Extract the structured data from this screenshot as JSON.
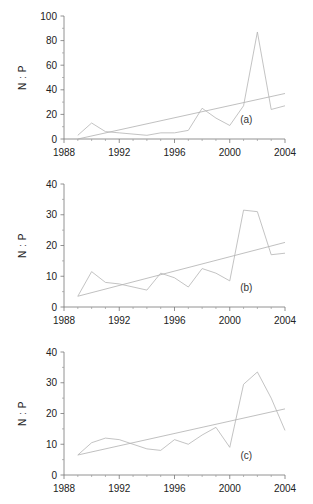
{
  "figure": {
    "type": "multi-panel-line-chart",
    "panels": 3,
    "background": "#ffffff",
    "line_color": "#b4b4b4",
    "axis_color": "#777777"
  },
  "chart_data": [
    {
      "type": "line",
      "panel": "a",
      "label": "(a)",
      "title": "",
      "xlabel": "",
      "ylabel": "N : P",
      "xlim": [
        1988,
        2004
      ],
      "ylim": [
        0,
        100
      ],
      "xticks": [
        1988,
        1992,
        1996,
        2000,
        2004
      ],
      "xticklabels": [
        "1988",
        "1992",
        "1996",
        "2000",
        "2004"
      ],
      "yticks": [
        0,
        20,
        40,
        60,
        80,
        100
      ],
      "yticklabels": [
        "0",
        "20",
        "40",
        "60",
        "80",
        "100"
      ],
      "minor_xticks": [
        1989,
        1990,
        1991,
        1993,
        1994,
        1995,
        1997,
        1998,
        1999,
        2001,
        2002,
        2003
      ],
      "minor_yticks": [
        10,
        30,
        50,
        70,
        90
      ],
      "grid": false,
      "legend": "none",
      "series": [
        {
          "name": "N:P ratio",
          "x": [
            1989,
            1990,
            1991,
            1992,
            1993,
            1994,
            1995,
            1996,
            1997,
            1998,
            1999,
            2000,
            2001,
            2002,
            2003,
            2004
          ],
          "values": [
            3,
            13,
            6,
            5,
            4,
            3,
            5,
            5,
            7,
            25,
            17,
            11,
            27,
            87,
            24,
            27
          ]
        },
        {
          "name": "linear trend",
          "x": [
            1989,
            2004
          ],
          "values": [
            0,
            37
          ]
        }
      ]
    },
    {
      "type": "line",
      "panel": "b",
      "label": "(b)",
      "title": "",
      "xlabel": "",
      "ylabel": "N : P",
      "xlim": [
        1988,
        2004
      ],
      "ylim": [
        0,
        40
      ],
      "xticks": [
        1988,
        1992,
        1996,
        2000,
        2004
      ],
      "xticklabels": [
        "1988",
        "1992",
        "1996",
        "2000",
        "2004"
      ],
      "yticks": [
        0,
        10,
        20,
        30,
        40
      ],
      "yticklabels": [
        "0",
        "10",
        "20",
        "30",
        "40"
      ],
      "minor_xticks": [
        1989,
        1990,
        1991,
        1993,
        1994,
        1995,
        1997,
        1998,
        1999,
        2001,
        2002,
        2003
      ],
      "minor_yticks": [
        5,
        15,
        25,
        35
      ],
      "grid": false,
      "legend": "none",
      "series": [
        {
          "name": "N:P ratio",
          "x": [
            1989,
            1990,
            1991,
            1992,
            1993,
            1994,
            1995,
            1996,
            1997,
            1998,
            1999,
            2000,
            2001,
            2002,
            2003,
            2004
          ],
          "values": [
            3.5,
            11.5,
            8,
            7.5,
            6.5,
            5.5,
            11,
            9.5,
            6.5,
            12.5,
            11,
            8.5,
            31.5,
            31,
            17,
            17.5
          ]
        },
        {
          "name": "linear trend",
          "x": [
            1989,
            2004
          ],
          "values": [
            3.5,
            21
          ]
        }
      ]
    },
    {
      "type": "line",
      "panel": "c",
      "label": "(c)",
      "title": "",
      "xlabel": "",
      "ylabel": "N : P",
      "xlim": [
        1988,
        2004
      ],
      "ylim": [
        0,
        40
      ],
      "xticks": [
        1988,
        1992,
        1996,
        2000,
        2004
      ],
      "xticklabels": [
        "1988",
        "1992",
        "1996",
        "2000",
        "2004"
      ],
      "yticks": [
        0,
        10,
        20,
        30,
        40
      ],
      "yticklabels": [
        "0",
        "10",
        "20",
        "30",
        "40"
      ],
      "minor_xticks": [
        1989,
        1990,
        1991,
        1993,
        1994,
        1995,
        1997,
        1998,
        1999,
        2001,
        2002,
        2003
      ],
      "minor_yticks": [
        5,
        15,
        25,
        35
      ],
      "grid": false,
      "legend": "none",
      "series": [
        {
          "name": "N:P ratio",
          "x": [
            1989,
            1990,
            1991,
            1992,
            1993,
            1994,
            1995,
            1996,
            1997,
            1998,
            1999,
            2000,
            2001,
            2002,
            2003,
            2004
          ],
          "values": [
            6.5,
            10.5,
            12,
            11.5,
            10,
            8.5,
            8,
            11.5,
            10,
            13,
            15.5,
            9,
            29.5,
            33.5,
            25,
            14.5
          ]
        },
        {
          "name": "linear trend",
          "x": [
            1989,
            2004
          ],
          "values": [
            6.5,
            21.5
          ]
        }
      ]
    }
  ]
}
